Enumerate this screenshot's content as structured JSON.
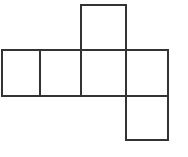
{
  "figure": {
    "name": "cube-net",
    "caption": "",
    "width": 188,
    "height": 157,
    "background_color": "#ffffff",
    "stroke_color": "#333333",
    "stroke_width": 1.6,
    "fill_color": "#ffffff"
  },
  "geometry": {
    "column_x": [
      2,
      40,
      81,
      126,
      168
    ],
    "row_y": [
      5,
      50,
      96,
      140
    ],
    "faces": [
      {
        "id": "face-top",
        "label": "",
        "x": 81,
        "y": 5,
        "width": 45,
        "height": 45,
        "row": "top",
        "column": 3
      },
      {
        "id": "face-middle-1",
        "label": "",
        "x": 2,
        "y": 50,
        "width": 38,
        "height": 46,
        "row": "middle",
        "column": 1
      },
      {
        "id": "face-middle-2",
        "label": "",
        "x": 40,
        "y": 50,
        "width": 41,
        "height": 46,
        "row": "middle",
        "column": 2
      },
      {
        "id": "face-middle-3",
        "label": "",
        "x": 81,
        "y": 50,
        "width": 45,
        "height": 46,
        "row": "middle",
        "column": 3
      },
      {
        "id": "face-middle-4",
        "label": "",
        "x": 126,
        "y": 50,
        "width": 42,
        "height": 46,
        "row": "middle",
        "column": 4
      },
      {
        "id": "face-bottom",
        "label": "",
        "x": 126,
        "y": 96,
        "width": 42,
        "height": 44,
        "row": "bottom",
        "column": 4
      }
    ]
  }
}
